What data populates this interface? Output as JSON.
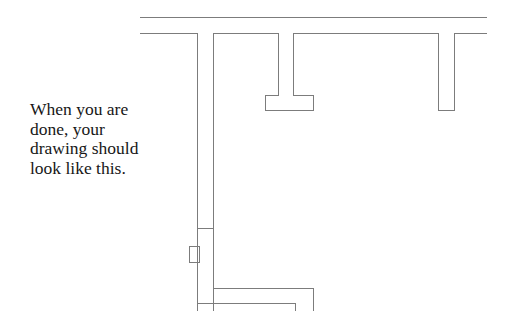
{
  "caption": {
    "lines": [
      "When you are",
      "done, your",
      "drawing should",
      "look like this."
    ]
  },
  "colors": {
    "background": "#ffffff",
    "line": "#7c7c7c",
    "text": "#171717"
  },
  "drawing": {
    "stroke_width": 1,
    "elements": [
      {
        "name": "top-wall-outer-line",
        "type": "polyline",
        "points": "140,17 487,17"
      },
      {
        "name": "top-wall-inner-segment-a",
        "type": "polyline",
        "points": "140,33 197,33"
      },
      {
        "name": "top-wall-inner-segment-b",
        "type": "polyline",
        "points": "213,33 278,33"
      },
      {
        "name": "top-wall-inner-segment-c",
        "type": "polyline",
        "points": "293,33 438,33"
      },
      {
        "name": "top-wall-inner-segment-d",
        "type": "polyline",
        "points": "454,33 487,33"
      },
      {
        "name": "left-wall-outer-line",
        "type": "polyline",
        "points": "197,33 197,311"
      },
      {
        "name": "left-wall-inner-line",
        "type": "polyline",
        "points": "213,33 213,311"
      },
      {
        "name": "wall-joint-tick",
        "type": "polyline",
        "points": "197,228 213,228"
      },
      {
        "name": "tee-column-outline",
        "type": "polyline",
        "points": "278,33 278,95 265,95 265,110 313,110 313,95 293,95 293,33"
      },
      {
        "name": "right-column-outline",
        "type": "polyline",
        "points": "438,33 438,110 454,110 454,33"
      },
      {
        "name": "wall-box",
        "type": "rect",
        "x": 189,
        "y": 246,
        "w": 10,
        "h": 16
      },
      {
        "name": "bottom-wall-outer-line",
        "type": "polyline",
        "points": "213,288 313,288 313,311"
      },
      {
        "name": "bottom-wall-inner-line",
        "type": "polyline",
        "points": "197,303 295,303 295,311"
      }
    ]
  }
}
